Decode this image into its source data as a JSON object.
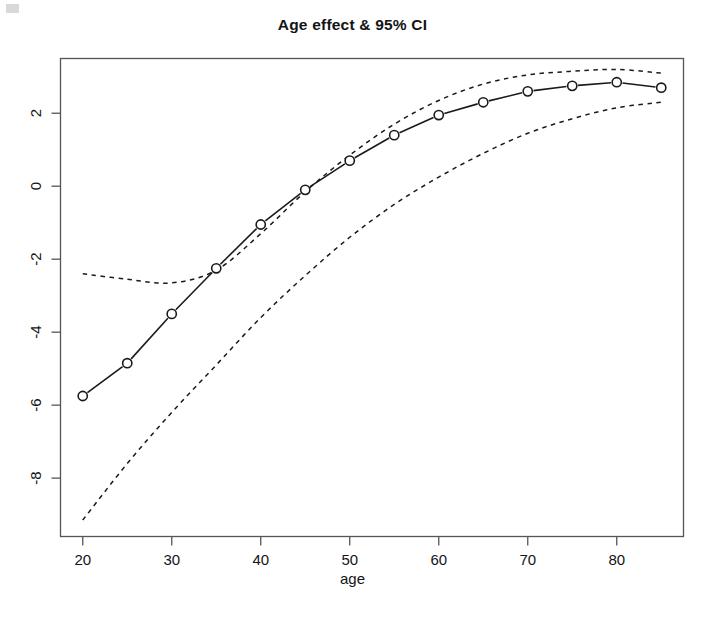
{
  "chart_data": {
    "type": "line",
    "title": "Age effect & 95% CI",
    "xlabel": "age",
    "ylabel": "",
    "xlim": [
      17.5,
      87.5
    ],
    "ylim": [
      -9.6,
      3.5
    ],
    "xticks": [
      20,
      30,
      40,
      50,
      60,
      70,
      80
    ],
    "yticks": [
      2,
      0,
      -2,
      -4,
      -6,
      -8
    ],
    "xtick_labels": [
      "20",
      "30",
      "40",
      "50",
      "60",
      "70",
      "80"
    ],
    "ytick_labels": [
      "2",
      "0",
      "-2",
      "-4",
      "-6",
      "-8"
    ],
    "grid": false,
    "legend": "none",
    "x": [
      20,
      25,
      30,
      35,
      40,
      45,
      50,
      55,
      60,
      65,
      70,
      75,
      80,
      85
    ],
    "series": [
      {
        "name": "Age effect (estimate)",
        "style": "solid-with-open-circles",
        "values": [
          -5.75,
          -4.85,
          -3.5,
          -2.25,
          -1.05,
          -0.1,
          0.7,
          1.4,
          1.95,
          2.3,
          2.6,
          2.75,
          2.85,
          2.7
        ]
      },
      {
        "name": "Upper 95% CI",
        "style": "dashed",
        "values": [
          -2.4,
          -2.55,
          -2.65,
          -2.3,
          -1.3,
          -0.15,
          0.85,
          1.7,
          2.35,
          2.8,
          3.05,
          3.15,
          3.2,
          3.1
        ]
      },
      {
        "name": "Lower 95% CI",
        "style": "dashed",
        "values": [
          -9.15,
          -7.6,
          -6.2,
          -4.9,
          -3.6,
          -2.45,
          -1.4,
          -0.5,
          0.25,
          0.9,
          1.45,
          1.85,
          2.15,
          2.3
        ]
      }
    ]
  },
  "axes": {
    "frame_color": "#555555",
    "line_color": "#1a1a1a",
    "marker": "open-circle"
  }
}
